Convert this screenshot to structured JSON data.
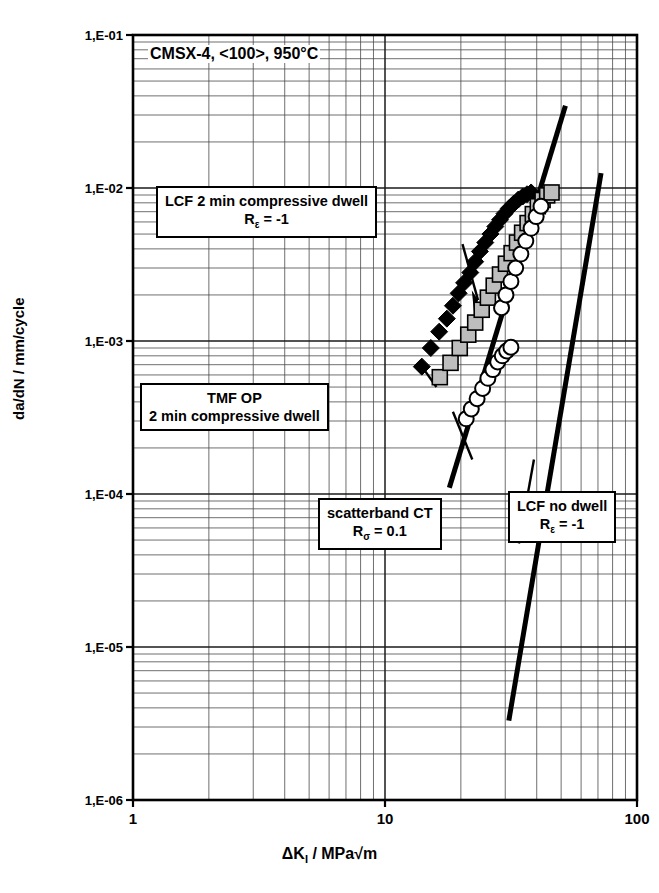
{
  "chart_data": {
    "type": "scatter",
    "title": "CMSX-4, <100>, 950°C",
    "xlabel": "ΔK_I / MPa√m",
    "ylabel": "da/dN / mm/cycle",
    "xscale": "log",
    "yscale": "log",
    "xlim": [
      1,
      100
    ],
    "ylim": [
      1e-06,
      0.1
    ],
    "grid": true,
    "legend_position": "none",
    "xtick_labels": [
      "1",
      "10",
      "100"
    ],
    "xtick_values": [
      1,
      10,
      100
    ],
    "ytick_labels": [
      "1,E-01",
      "1,E-02",
      "1,E-03",
      "1,E-04",
      "1,E-05",
      "1,E-06"
    ],
    "ytick_values": [
      0.1,
      0.01,
      0.001,
      0.0001,
      1e-05,
      1e-06
    ],
    "series": [
      {
        "name": "LCF 2 min compressive dwell",
        "marker": "filled-diamond",
        "color": "#000000",
        "points": [
          [
            14.0,
            0.00068
          ],
          [
            15.2,
            0.0009
          ],
          [
            16.4,
            0.00115
          ],
          [
            17.6,
            0.0014
          ],
          [
            18.6,
            0.0017
          ],
          [
            19.6,
            0.00205
          ],
          [
            20.6,
            0.0024
          ],
          [
            21.8,
            0.0028
          ],
          [
            22.8,
            0.0033
          ],
          [
            23.8,
            0.00385
          ],
          [
            25.0,
            0.0044
          ],
          [
            26.2,
            0.005
          ],
          [
            27.4,
            0.0056
          ],
          [
            28.6,
            0.0062
          ],
          [
            29.8,
            0.0068
          ],
          [
            31.0,
            0.00735
          ],
          [
            32.4,
            0.0079
          ],
          [
            33.8,
            0.0084
          ],
          [
            35.2,
            0.0088
          ],
          [
            36.6,
            0.0091
          ],
          [
            38.0,
            0.00935
          ]
        ]
      },
      {
        "name": "TMF OP 2 min compressive dwell",
        "marker": "shaded-square",
        "color": "#b0b0b0",
        "points": [
          [
            16.5,
            0.00058
          ],
          [
            18.2,
            0.00072
          ],
          [
            19.8,
            0.0009
          ],
          [
            21.4,
            0.0011
          ],
          [
            22.8,
            0.00132
          ],
          [
            24.2,
            0.0016
          ],
          [
            25.6,
            0.00192
          ],
          [
            27.0,
            0.0023
          ],
          [
            28.6,
            0.00272
          ],
          [
            30.2,
            0.0032
          ],
          [
            31.8,
            0.00375
          ],
          [
            33.4,
            0.0044
          ],
          [
            35.0,
            0.0051
          ],
          [
            36.8,
            0.0059
          ],
          [
            38.6,
            0.00675
          ],
          [
            40.4,
            0.0076
          ],
          [
            42.2,
            0.00835
          ],
          [
            44.0,
            0.00895
          ],
          [
            45.8,
            0.00935
          ]
        ]
      },
      {
        "name": "LCF no dwell",
        "marker": "open-circle",
        "color": "#ffffff",
        "points": [
          [
            21.0,
            0.00031
          ],
          [
            22.0,
            0.00036
          ],
          [
            23.2,
            0.00042
          ],
          [
            24.4,
            0.00049
          ],
          [
            25.6,
            0.00057
          ],
          [
            26.8,
            0.00065
          ],
          [
            28.0,
            0.00073
          ],
          [
            29.2,
            0.0008
          ],
          [
            30.4,
            0.00086
          ],
          [
            31.6,
            0.00091
          ],
          [
            29.0,
            0.00165
          ],
          [
            30.2,
            0.002
          ],
          [
            31.6,
            0.00245
          ],
          [
            33.0,
            0.003
          ],
          [
            34.6,
            0.0037
          ],
          [
            36.2,
            0.0045
          ],
          [
            38.0,
            0.00545
          ],
          [
            39.8,
            0.0065
          ],
          [
            41.6,
            0.0076
          ]
        ]
      }
    ],
    "scatterband": {
      "name": "scatterband CT",
      "lines": [
        {
          "name": "upper-bound",
          "p1": [
            18.0,
            0.00011
          ],
          "p2": [
            52.0,
            0.0345
          ]
        },
        {
          "name": "lower-bound",
          "p1": [
            31.0,
            3.3e-06
          ],
          "p2": [
            72.0,
            0.0125
          ]
        }
      ]
    }
  },
  "annotations": {
    "box_lcf_dwell": {
      "line1": "LCF 2 min compressive dwell",
      "line2_pre": "R",
      "line2_sub": "ε",
      "line2_post": " = -1"
    },
    "box_tmf": {
      "line1": "TMF OP",
      "line2": "2 min compressive dwell"
    },
    "box_scatterband": {
      "line1": "scatterband CT",
      "line2_pre": "R",
      "line2_sub": "σ",
      "line2_post": " = 0.1"
    },
    "box_lcf_no_dwell": {
      "line1": "LCF no dwell",
      "line2_pre": "R",
      "line2_sub": "ε",
      "line2_post": " = -1"
    }
  },
  "axis_titles": {
    "x_pre": "ΔK",
    "x_sub": "I",
    "x_post": " / MPa√m",
    "y": "da/dN / mm/cycle"
  }
}
